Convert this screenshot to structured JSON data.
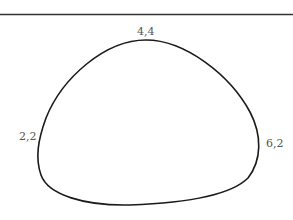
{
  "diagram": {
    "top_rule": {
      "color": "#333333"
    },
    "curve": {
      "color": "#1a1a1a",
      "closed": true
    },
    "points": [
      {
        "label": "4,4",
        "position": "top"
      },
      {
        "label": "2,2",
        "position": "left"
      },
      {
        "label": "6,2",
        "position": "right"
      }
    ]
  }
}
